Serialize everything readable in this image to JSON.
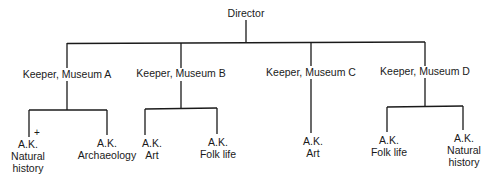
{
  "diagram": {
    "type": "org-chart",
    "root": {
      "label": "Director",
      "children": [
        {
          "label": "Keeper, Museum A",
          "children": [
            {
              "lines": [
                "A.K.",
                "Natural",
                "history"
              ],
              "marker": "+"
            },
            {
              "lines": [
                "A.K.",
                "Archaeology"
              ]
            }
          ]
        },
        {
          "label": "Keeper, Museum B",
          "children": [
            {
              "lines": [
                "A.K.",
                "Art"
              ]
            },
            {
              "lines": [
                "A.K.",
                "Folk life"
              ]
            }
          ]
        },
        {
          "label": "Keeper, Museum C",
          "children": [
            {
              "lines": [
                "A.K.",
                "Art"
              ]
            }
          ]
        },
        {
          "label": "Keeper, Museum D",
          "children": [
            {
              "lines": [
                "A.K.",
                "Folk life"
              ]
            },
            {
              "lines": [
                "A.K.",
                "Natural",
                "history"
              ]
            }
          ]
        }
      ]
    },
    "line_color": "#1a1a1a"
  }
}
